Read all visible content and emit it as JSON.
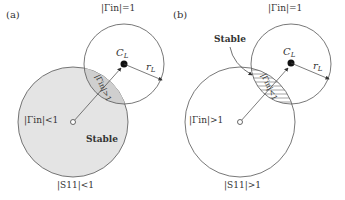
{
  "panels": [
    {
      "id": "a",
      "label": "(a)",
      "small_circle_label": "|Γin|=1",
      "center_label": "C",
      "center_sub": "L",
      "radius_label": "r",
      "radius_sub": "L",
      "overlap_label": "|Γin|>1",
      "inside_big_label": "|Γin|<1",
      "region_label": "Stable",
      "big_circle_label": "|S11|<1"
    },
    {
      "id": "b",
      "label": "(b)",
      "small_circle_label": "|Γin|=1",
      "center_label": "C",
      "center_sub": "L",
      "radius_label": "r",
      "radius_sub": "L",
      "overlap_label": "|Γin|<1",
      "inside_big_label": "|Γin|>1",
      "region_label": "Stable",
      "big_circle_label": "|S11|>1"
    }
  ],
  "colors": {
    "stable_fill": "#e4e4e4",
    "line": "#555555"
  }
}
